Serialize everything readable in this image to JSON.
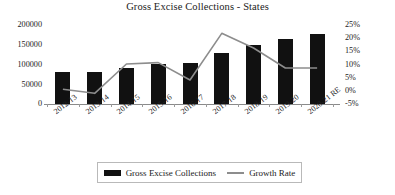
{
  "chart_data": {
    "type": "bar",
    "title": "Gross Excise Collections - States",
    "xlabel": "",
    "ylabel": "",
    "categories": [
      "2012-13",
      "2013-14",
      "2014-15",
      "2015-16",
      "2016-17",
      "2017-18",
      "2018-19",
      "2019-20",
      "2020-21 RE"
    ],
    "series": [
      {
        "name": "Gross Excise Collections",
        "type": "bar",
        "axis": "left",
        "color": "#111111",
        "values": [
          80000,
          80000,
          90000,
          100000,
          103000,
          128000,
          148000,
          162000,
          175000
        ]
      },
      {
        "name": "Growth Rate",
        "type": "line",
        "axis": "right",
        "color": "#8d8d8d",
        "values": [
          0.5,
          -1,
          10,
          10.5,
          4,
          21.5,
          16,
          8.5,
          8.5
        ]
      }
    ],
    "ylim": [
      0,
      200000
    ],
    "y2lim": [
      -5,
      25
    ],
    "yticks": [
      0,
      50000,
      100000,
      150000,
      200000
    ],
    "ytick_labels": [
      "0",
      "50000",
      "100000",
      "150000",
      "200000"
    ],
    "y2ticks": [
      -5,
      0,
      5,
      10,
      15,
      20,
      25
    ],
    "y2tick_labels": [
      "-5%",
      "0%",
      "5%",
      "10%",
      "15%",
      "20%",
      "25%"
    ],
    "grid": false,
    "legend_position": "bottom"
  },
  "legend": {
    "bar_label": "Gross Excise Collections",
    "line_label": "Growth Rate"
  }
}
